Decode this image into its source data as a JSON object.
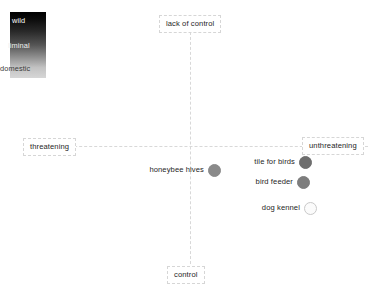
{
  "chart_data": {
    "type": "scatter",
    "title": "",
    "subtitle": "",
    "xlabel": "",
    "ylabel": "",
    "grid": false,
    "legend_position": "top-left",
    "axes": {
      "x_negative_label": "threatening",
      "x_positive_label": "unthreatening",
      "y_positive_label": "lack of control",
      "y_negative_label": "control",
      "x_axis_y_position": 146,
      "y_axis_x_position": 190,
      "xlim": [
        -1,
        1
      ],
      "ylim": [
        -1,
        1
      ]
    },
    "legend": {
      "type": "gradient",
      "title": "",
      "entries": [
        {
          "label": "wild",
          "color": "#000000",
          "text_color": "#ffffff"
        },
        {
          "label": "liminal",
          "color": "#555555",
          "text_color": "#efefef"
        },
        {
          "label": "domestic",
          "color": "#d6d6d6",
          "text_color": "#3a3a3a"
        }
      ],
      "gradient_from": "#000000",
      "gradient_to": "#d6d6d6"
    },
    "points": [
      {
        "label": "honeybee hives",
        "x": 0.14,
        "y": -0.19,
        "px": 214,
        "py": 170,
        "fill": "#8a8a8a",
        "stroke": "#8a8a8a",
        "category": "liminal"
      },
      {
        "label": "tile for birds",
        "x": 0.67,
        "y": -0.13,
        "px": 305,
        "py": 162,
        "fill": "#6e6e6e",
        "stroke": "#6e6e6e",
        "category": "liminal"
      },
      {
        "label": "bird feeder",
        "x": 0.65,
        "y": -0.29,
        "px": 303,
        "py": 182,
        "fill": "#7d7d7d",
        "stroke": "#7d7d7d",
        "category": "liminal"
      },
      {
        "label": "dog kennel",
        "x": 0.69,
        "y": -0.49,
        "px": 310,
        "py": 208,
        "fill": "#fbfbfb",
        "stroke": "#c9c9c9",
        "category": "domestic"
      }
    ]
  }
}
